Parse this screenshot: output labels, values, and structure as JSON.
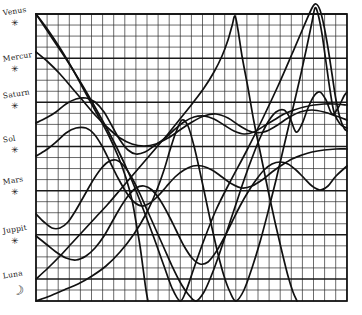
{
  "chart_data": {
    "type": "line",
    "xlabel": "",
    "ylabel": "",
    "grid": true,
    "legend_position": "left",
    "plot_area": {
      "x": 36,
      "y": 14,
      "width": 311,
      "height": 287
    },
    "axis_ranges": {
      "xlim": [
        0,
        28
      ],
      "ylim": [
        0,
        26
      ]
    },
    "grid_spacing": {
      "minor_x": 11.1,
      "minor_y": 11.04,
      "major_every_y": 4
    },
    "legend": [
      {
        "name": "Venus",
        "glyph": "✳",
        "symbol_name": "star-asterisk",
        "y": 18
      },
      {
        "name": "Mercur",
        "glyph": "✳",
        "symbol_name": "star-asterisk",
        "y": 64
      },
      {
        "name": "Saturn",
        "glyph": "✳",
        "symbol_name": "star-asterisk",
        "y": 101
      },
      {
        "name": "Sol",
        "glyph": "✳",
        "symbol_name": "star-asterisk",
        "y": 145
      },
      {
        "name": "Mars",
        "glyph": "✳",
        "symbol_name": "star-asterisk",
        "y": 187
      },
      {
        "name": "Juppit",
        "glyph": "✳",
        "symbol_name": "star-asterisk",
        "y": 236
      },
      {
        "name": "Luna",
        "glyph": "☽",
        "symbol_name": "crescent-moon",
        "y": 281
      }
    ],
    "series": [
      {
        "name": "Venus",
        "stroke": "#111111",
        "points": [
          [
            36,
            14
          ],
          [
            52,
            38
          ],
          [
            68,
            62
          ],
          [
            84,
            88
          ],
          [
            100,
            116
          ],
          [
            116,
            146
          ],
          [
            130,
            176
          ],
          [
            142,
            206
          ],
          [
            154,
            238
          ],
          [
            164,
            266
          ],
          [
            172,
            288
          ],
          [
            180,
            301
          ],
          [
            186,
            291
          ],
          [
            194,
            268
          ],
          [
            204,
            240
          ],
          [
            216,
            210
          ],
          [
            230,
            182
          ],
          [
            246,
            152
          ],
          [
            262,
            120
          ],
          [
            278,
            86
          ],
          [
            292,
            54
          ],
          [
            304,
            26
          ],
          [
            312,
            8
          ],
          [
            316,
            4
          ],
          [
            320,
            10
          ],
          [
            324,
            26
          ],
          [
            328,
            48
          ],
          [
            332,
            74
          ],
          [
            336,
            100
          ],
          [
            340,
            118
          ],
          [
            344,
            128
          ],
          [
            347,
            131
          ]
        ]
      },
      {
        "name": "Mercur",
        "stroke": "#111111",
        "points": [
          [
            36,
            14
          ],
          [
            48,
            30
          ],
          [
            60,
            48
          ],
          [
            72,
            68
          ],
          [
            84,
            90
          ],
          [
            96,
            112
          ],
          [
            108,
            134
          ],
          [
            118,
            156
          ],
          [
            126,
            178
          ],
          [
            132,
            200
          ],
          [
            136,
            222
          ],
          [
            140,
            246
          ],
          [
            143,
            268
          ],
          [
            146,
            290
          ],
          [
            148,
            301
          ]
        ]
      },
      {
        "name": "Saturn",
        "stroke": "#111111",
        "points": [
          [
            36,
            123
          ],
          [
            46,
            118
          ],
          [
            56,
            112
          ],
          [
            66,
            104
          ],
          [
            76,
            99
          ],
          [
            86,
            98
          ],
          [
            95,
            102
          ],
          [
            104,
            112
          ],
          [
            112,
            126
          ],
          [
            120,
            140
          ],
          [
            128,
            150
          ],
          [
            136,
            154
          ],
          [
            145,
            152
          ],
          [
            154,
            146
          ],
          [
            164,
            139
          ],
          [
            174,
            130
          ],
          [
            184,
            122
          ],
          [
            194,
            117
          ],
          [
            204,
            116
          ],
          [
            214,
            119
          ],
          [
            224,
            125
          ],
          [
            234,
            131
          ],
          [
            244,
            134
          ],
          [
            254,
            132
          ],
          [
            264,
            126
          ],
          [
            274,
            120
          ],
          [
            284,
            114
          ],
          [
            294,
            110
          ],
          [
            304,
            107
          ],
          [
            314,
            105
          ],
          [
            324,
            104
          ],
          [
            334,
            104
          ],
          [
            347,
            105
          ]
        ]
      },
      {
        "name": "Sol",
        "stroke": "#111111",
        "points": [
          [
            36,
            156
          ],
          [
            46,
            150
          ],
          [
            56,
            142
          ],
          [
            66,
            133
          ],
          [
            76,
            128
          ],
          [
            86,
            128
          ],
          [
            94,
            134
          ],
          [
            102,
            146
          ],
          [
            110,
            162
          ],
          [
            118,
            178
          ],
          [
            126,
            192
          ],
          [
            134,
            202
          ],
          [
            142,
            206
          ],
          [
            150,
            203
          ],
          [
            158,
            196
          ],
          [
            166,
            187
          ],
          [
            175,
            177
          ],
          [
            184,
            170
          ],
          [
            193,
            166
          ],
          [
            202,
            166
          ],
          [
            212,
            170
          ],
          [
            222,
            177
          ],
          [
            232,
            184
          ],
          [
            242,
            188
          ],
          [
            252,
            186
          ],
          [
            262,
            180
          ],
          [
            272,
            172
          ],
          [
            282,
            165
          ],
          [
            292,
            159
          ],
          [
            302,
            155
          ],
          [
            312,
            152
          ],
          [
            324,
            150
          ],
          [
            336,
            149
          ],
          [
            347,
            149
          ]
        ]
      },
      {
        "name": "Mars",
        "stroke": "#111111",
        "points": [
          [
            36,
            279
          ],
          [
            48,
            268
          ],
          [
            60,
            256
          ],
          [
            72,
            243
          ],
          [
            84,
            230
          ],
          [
            96,
            217
          ],
          [
            108,
            204
          ],
          [
            120,
            190
          ],
          [
            132,
            176
          ],
          [
            144,
            162
          ],
          [
            156,
            148
          ],
          [
            168,
            134
          ],
          [
            180,
            119
          ],
          [
            192,
            104
          ],
          [
            204,
            88
          ],
          [
            214,
            72
          ],
          [
            222,
            56
          ],
          [
            228,
            40
          ],
          [
            232,
            26
          ],
          [
            235,
            16
          ],
          [
            238,
            30
          ],
          [
            242,
            56
          ],
          [
            248,
            88
          ],
          [
            254,
            122
          ],
          [
            261,
            156
          ],
          [
            268,
            190
          ],
          [
            275,
            222
          ],
          [
            282,
            252
          ],
          [
            288,
            276
          ],
          [
            293,
            292
          ],
          [
            297,
            301
          ]
        ]
      },
      {
        "name": "Juppit",
        "stroke": "#111111",
        "points": [
          [
            36,
            236
          ],
          [
            46,
            244
          ],
          [
            56,
            252
          ],
          [
            66,
            258
          ],
          [
            76,
            260
          ],
          [
            86,
            256
          ],
          [
            95,
            248
          ],
          [
            104,
            236
          ],
          [
            112,
            222
          ],
          [
            120,
            208
          ],
          [
            128,
            196
          ],
          [
            136,
            188
          ],
          [
            144,
            186
          ],
          [
            152,
            190
          ],
          [
            160,
            200
          ],
          [
            168,
            214
          ],
          [
            176,
            230
          ],
          [
            184,
            246
          ],
          [
            192,
            258
          ],
          [
            200,
            264
          ],
          [
            208,
            262
          ],
          [
            216,
            252
          ],
          [
            224,
            238
          ],
          [
            232,
            222
          ],
          [
            240,
            206
          ],
          [
            248,
            192
          ],
          [
            256,
            180
          ],
          [
            264,
            170
          ],
          [
            272,
            164
          ],
          [
            280,
            162
          ],
          [
            288,
            164
          ],
          [
            296,
            170
          ],
          [
            304,
            178
          ],
          [
            312,
            186
          ],
          [
            320,
            190
          ],
          [
            328,
            186
          ],
          [
            336,
            176
          ],
          [
            347,
            166
          ]
        ]
      },
      {
        "name": "Luna",
        "stroke": "#111111",
        "points": [
          [
            36,
            214
          ],
          [
            44,
            222
          ],
          [
            52,
            228
          ],
          [
            60,
            228
          ],
          [
            68,
            222
          ],
          [
            76,
            210
          ],
          [
            84,
            196
          ],
          [
            92,
            182
          ],
          [
            100,
            170
          ],
          [
            108,
            162
          ],
          [
            116,
            160
          ],
          [
            124,
            166
          ],
          [
            132,
            178
          ],
          [
            140,
            194
          ],
          [
            148,
            212
          ],
          [
            156,
            230
          ],
          [
            164,
            248
          ],
          [
            172,
            266
          ],
          [
            180,
            282
          ],
          [
            188,
            294
          ],
          [
            196,
            301
          ],
          [
            204,
            292
          ],
          [
            212,
            274
          ],
          [
            220,
            252
          ],
          [
            228,
            228
          ],
          [
            236,
            204
          ],
          [
            244,
            180
          ],
          [
            252,
            158
          ],
          [
            260,
            138
          ],
          [
            268,
            122
          ],
          [
            276,
            112
          ],
          [
            284,
            110
          ],
          [
            290,
            118
          ],
          [
            296,
            132
          ],
          [
            302,
            124
          ],
          [
            308,
            108
          ],
          [
            314,
            96
          ],
          [
            320,
            92
          ],
          [
            326,
            100
          ],
          [
            332,
            114
          ],
          [
            338,
            108
          ],
          [
            344,
            96
          ],
          [
            347,
            92
          ]
        ]
      },
      {
        "name": "descending-upper-trace",
        "stroke": "#111111",
        "points": [
          [
            36,
            52
          ],
          [
            48,
            62
          ],
          [
            60,
            74
          ],
          [
            72,
            88
          ],
          [
            84,
            102
          ],
          [
            96,
            116
          ],
          [
            108,
            128
          ],
          [
            120,
            138
          ],
          [
            132,
            144
          ],
          [
            144,
            146
          ],
          [
            156,
            144
          ],
          [
            168,
            138
          ],
          [
            180,
            130
          ],
          [
            192,
            122
          ],
          [
            204,
            116
          ],
          [
            216,
            114
          ],
          [
            228,
            118
          ],
          [
            240,
            126
          ],
          [
            252,
            132
          ],
          [
            264,
            132
          ],
          [
            276,
            126
          ],
          [
            288,
            118
          ],
          [
            300,
            112
          ],
          [
            312,
            110
          ],
          [
            324,
            112
          ],
          [
            336,
            116
          ],
          [
            347,
            120
          ]
        ]
      },
      {
        "name": "tall-peak-trace",
        "stroke": "#111111",
        "points": [
          [
            36,
            301
          ],
          [
            50,
            296
          ],
          [
            64,
            290
          ],
          [
            78,
            284
          ],
          [
            92,
            276
          ],
          [
            106,
            266
          ],
          [
            120,
            252
          ],
          [
            134,
            234
          ],
          [
            146,
            214
          ],
          [
            156,
            192
          ],
          [
            164,
            170
          ],
          [
            170,
            150
          ],
          [
            176,
            132
          ],
          [
            182,
            120
          ],
          [
            188,
            126
          ],
          [
            194,
            146
          ],
          [
            200,
            172
          ],
          [
            206,
            200
          ],
          [
            212,
            228
          ],
          [
            218,
            254
          ],
          [
            224,
            276
          ],
          [
            230,
            292
          ],
          [
            236,
            301
          ],
          [
            244,
            290
          ],
          [
            252,
            268
          ],
          [
            260,
            242
          ],
          [
            268,
            212
          ],
          [
            276,
            180
          ],
          [
            284,
            146
          ],
          [
            292,
            112
          ],
          [
            300,
            78
          ],
          [
            307,
            46
          ],
          [
            312,
            22
          ],
          [
            315,
            8
          ],
          [
            318,
            14
          ],
          [
            322,
            34
          ],
          [
            326,
            62
          ],
          [
            330,
            90
          ],
          [
            334,
            112
          ],
          [
            340,
            124
          ],
          [
            347,
            128
          ]
        ]
      }
    ]
  }
}
